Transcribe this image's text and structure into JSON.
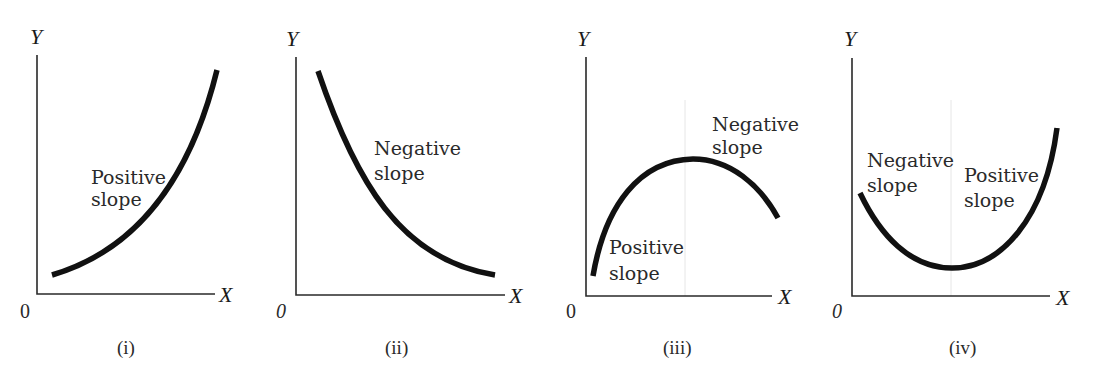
{
  "figure": {
    "panels": [
      {
        "id": "i",
        "caption": "(i)",
        "y_axis_label": "Y",
        "x_axis_label": "X",
        "origin_label": "0",
        "curve_shape": "increasing, convex",
        "annotations": [
          {
            "line1": "Positive",
            "line2": "slope"
          }
        ]
      },
      {
        "id": "ii",
        "caption": "(ii)",
        "y_axis_label": "Y",
        "x_axis_label": "X",
        "origin_label": "0",
        "curve_shape": "decreasing, convex",
        "annotations": [
          {
            "line1": "Negative",
            "line2": "slope"
          }
        ]
      },
      {
        "id": "iii",
        "caption": "(iii)",
        "y_axis_label": "Y",
        "x_axis_label": "X",
        "origin_label": "0",
        "curve_shape": "inverted U (maximum)",
        "annotations": [
          {
            "line1": "Negative",
            "line2": "slope"
          },
          {
            "line1": "Positive",
            "line2": "slope"
          }
        ]
      },
      {
        "id": "iv",
        "caption": "(iv)",
        "y_axis_label": "Y",
        "x_axis_label": "X",
        "origin_label": "0",
        "curve_shape": "U-shaped (minimum)",
        "annotations": [
          {
            "line1": "Negative",
            "line2": "slope"
          },
          {
            "line1": "Positive",
            "line2": "slope"
          }
        ]
      }
    ]
  },
  "colors": {
    "curve": "#111111",
    "axis": "#2a2a2a",
    "guide": "#e6e6e6",
    "background": "#ffffff"
  }
}
